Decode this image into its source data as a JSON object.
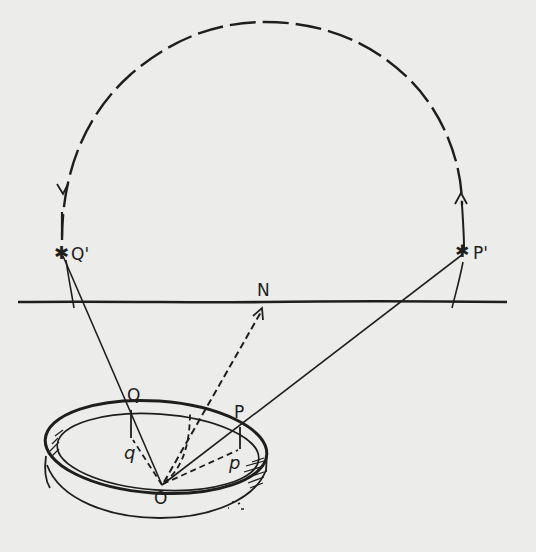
{
  "figure": {
    "colors": {
      "ink": "#1e1e1e",
      "paper": "#ececea"
    },
    "labels": {
      "Q_prime": "Q'",
      "P_prime": "P'",
      "N": "N",
      "Q": "Q",
      "P": "P",
      "q": "q",
      "p": "p",
      "O": "O"
    },
    "points": {
      "Q_prime": {
        "x": 63,
        "y": 254
      },
      "P_prime": {
        "x": 464,
        "y": 252
      },
      "N": {
        "x": 264,
        "y": 302
      },
      "Q": {
        "x": 131,
        "y": 410
      },
      "P": {
        "x": 240,
        "y": 427
      },
      "q": {
        "x": 131,
        "y": 438
      },
      "p": {
        "x": 240,
        "y": 450
      },
      "O": {
        "x": 162,
        "y": 485
      }
    },
    "markers": {
      "star_glyph": "✱",
      "arc_arrow_left": "down-arrow",
      "arc_arrow_right": "up-arrow"
    }
  }
}
